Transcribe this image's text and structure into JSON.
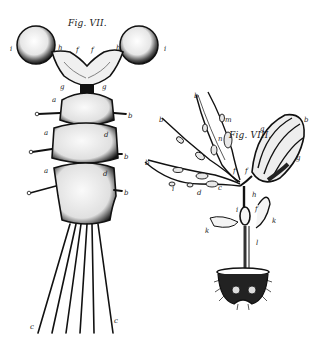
{
  "figures": [
    {
      "id": "fig7",
      "title": "Fig. VII.",
      "labels": [
        {
          "text": "i",
          "x": 10,
          "y": 46
        },
        {
          "text": "h",
          "x": 58,
          "y": 45
        },
        {
          "text": "f",
          "x": 76,
          "y": 47
        },
        {
          "text": "f",
          "x": 91,
          "y": 47
        },
        {
          "text": "h",
          "x": 116,
          "y": 45
        },
        {
          "text": "i",
          "x": 164,
          "y": 46
        },
        {
          "text": "g",
          "x": 60,
          "y": 84
        },
        {
          "text": "g",
          "x": 102,
          "y": 84
        },
        {
          "text": "a",
          "x": 52,
          "y": 97
        },
        {
          "text": "b",
          "x": 128,
          "y": 113
        },
        {
          "text": "a",
          "x": 44,
          "y": 130
        },
        {
          "text": "d",
          "x": 104,
          "y": 132
        },
        {
          "text": "b",
          "x": 124,
          "y": 154
        },
        {
          "text": "a",
          "x": 44,
          "y": 168
        },
        {
          "text": "d",
          "x": 103,
          "y": 171
        },
        {
          "text": "b",
          "x": 124,
          "y": 190
        },
        {
          "text": "c",
          "x": 30,
          "y": 324
        },
        {
          "text": "c",
          "x": 114,
          "y": 318
        }
      ]
    },
    {
      "id": "fig8",
      "title": "Fig. VIII.",
      "labels": [
        {
          "text": "b",
          "x": 194,
          "y": 93
        },
        {
          "text": "m",
          "x": 225,
          "y": 117
        },
        {
          "text": "g",
          "x": 260,
          "y": 126
        },
        {
          "text": "b",
          "x": 304,
          "y": 117
        },
        {
          "text": "b",
          "x": 159,
          "y": 117
        },
        {
          "text": "n",
          "x": 218,
          "y": 136
        },
        {
          "text": "b",
          "x": 145,
          "y": 160
        },
        {
          "text": "g",
          "x": 296,
          "y": 155
        },
        {
          "text": "f",
          "x": 233,
          "y": 168
        },
        {
          "text": "f",
          "x": 245,
          "y": 168
        },
        {
          "text": "i",
          "x": 172,
          "y": 186
        },
        {
          "text": "d",
          "x": 197,
          "y": 190
        },
        {
          "text": "c",
          "x": 218,
          "y": 185
        },
        {
          "text": "h",
          "x": 252,
          "y": 192
        },
        {
          "text": "i",
          "x": 236,
          "y": 207
        },
        {
          "text": "f",
          "x": 255,
          "y": 206
        },
        {
          "text": "k",
          "x": 272,
          "y": 218
        },
        {
          "text": "k",
          "x": 205,
          "y": 228
        },
        {
          "text": "l",
          "x": 256,
          "y": 240
        }
      ]
    }
  ],
  "colors": {
    "ink": "#1a1a1a",
    "paper": "#ffffff",
    "shade": "#555555"
  }
}
